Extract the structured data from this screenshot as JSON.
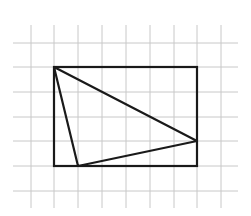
{
  "diagram": {
    "grid": {
      "color": "#c8c8c8",
      "vertical_x": [
        31,
        54,
        78,
        102,
        126,
        150,
        174,
        197,
        221
      ],
      "horizontal_y": [
        43,
        67,
        92,
        117,
        141,
        166,
        191
      ],
      "x_extent": [
        13,
        238
      ],
      "y_extent": [
        25,
        208
      ],
      "cell_size_px": 24
    },
    "rectangle": {
      "x": 54,
      "y": 67,
      "width": 143,
      "height": 99,
      "grid_width_cells": 6,
      "grid_height_cells": 4,
      "stroke": "#1a1a1a"
    },
    "triangle": {
      "vertices": [
        [
          54,
          67
        ],
        [
          197,
          141
        ],
        [
          78,
          166
        ]
      ],
      "vertices_grid": [
        [
          0,
          0
        ],
        [
          6,
          3
        ],
        [
          1,
          4
        ]
      ],
      "stroke": "#1a1a1a"
    }
  }
}
